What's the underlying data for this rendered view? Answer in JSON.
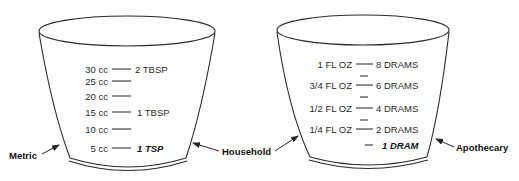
{
  "diagram": {
    "cup_left": {
      "rows": [
        {
          "left": "30 cc",
          "right": "2 TBSP",
          "emphasis": false
        },
        {
          "left": "25 cc",
          "right": "",
          "emphasis": false
        },
        {
          "left": "20 cc",
          "right": "",
          "emphasis": false
        },
        {
          "left": "15 cc",
          "right": "1 TBSP",
          "emphasis": false
        },
        {
          "left": "10 cc",
          "right": "",
          "emphasis": false
        },
        {
          "left": "5 cc",
          "right": "1 TSP",
          "emphasis": true
        }
      ]
    },
    "cup_right": {
      "rows": [
        {
          "left": "1 FL OZ",
          "right": "8 DRAMS",
          "emphasis": false
        },
        {
          "left": "3/4 FL OZ",
          "right": "6 DRAMS",
          "emphasis": false
        },
        {
          "left": "1/2 FL OZ",
          "right": "4 DRAMS",
          "emphasis": false
        },
        {
          "left": "1/4 FL OZ",
          "right": "2 DRAMS",
          "emphasis": false
        },
        {
          "left": "",
          "right": "1 DRAM",
          "emphasis": true
        }
      ]
    },
    "callouts": {
      "metric": "Metric",
      "household": "Household",
      "apothecary": "Apothecary"
    }
  }
}
